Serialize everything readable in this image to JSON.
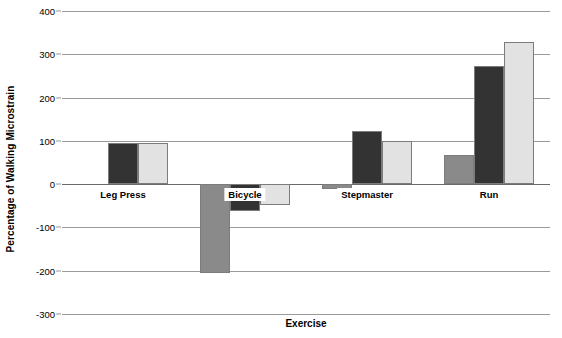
{
  "chart_data": {
    "type": "bar",
    "title": "",
    "xlabel": "Exercise",
    "ylabel": "Percentage of Walking Microstrain",
    "categories": [
      "Leg Press",
      "Bicycle",
      "Stepmaster",
      "Run"
    ],
    "ylim": [
      -300,
      400
    ],
    "ytick_labels": [
      "400",
      "300",
      "200",
      "100",
      "0",
      "-100",
      "-200",
      "-300"
    ],
    "ytick_values": [
      400,
      300,
      200,
      100,
      0,
      -100,
      -200,
      -300
    ],
    "ytick_interval": 100,
    "grid": true,
    "legend": "none",
    "series": [
      {
        "name": "series-1",
        "color": "#8a8a8a",
        "values": [
          null,
          -205,
          -12,
          68
        ]
      },
      {
        "name": "series-2",
        "color": "#333333",
        "values": [
          95,
          -62,
          123,
          273
        ]
      },
      {
        "name": "series-3",
        "color": "#e2e2e2",
        "values": [
          96,
          -48,
          100,
          328
        ]
      }
    ]
  },
  "colors": {
    "background": "#ffffff",
    "gridline": "#9a9a9a",
    "axis": "#6a6a6a",
    "bar_medium": "#8a8a8a",
    "bar_dark": "#333333",
    "bar_light": "#e2e2e2",
    "bar_outline": "#7c7c7c",
    "text": "#000000"
  }
}
